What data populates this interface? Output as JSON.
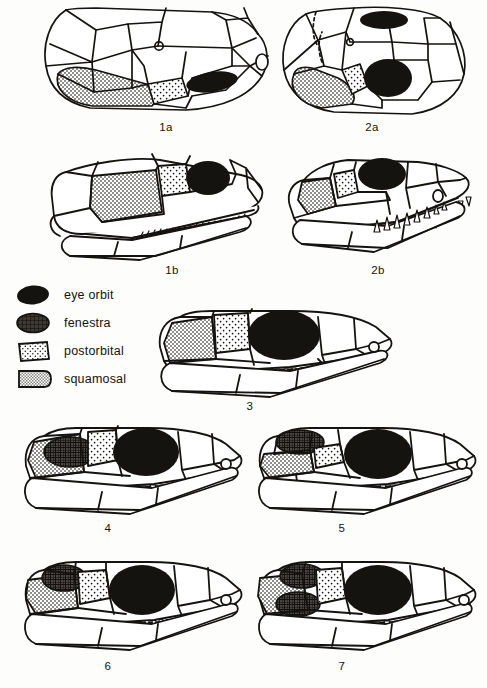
{
  "figure": {
    "type": "scientific-illustration",
    "background_color": "#fdfdfb",
    "ink_color": "#15130f"
  },
  "legend": {
    "items": [
      {
        "key": "eye-orbit",
        "label": "eye  orbit",
        "swatch": "solid-black-blob",
        "fill": "#15130f"
      },
      {
        "key": "fenestra",
        "label": "fenestra",
        "swatch": "crosshatched-blob",
        "fill": "#2b2723"
      },
      {
        "key": "postorbital",
        "label": "postorbital",
        "swatch": "dotted-parallelogram",
        "fill": "#ffffff"
      },
      {
        "key": "squamosal",
        "label": "squamosal",
        "swatch": "stippled-gray-shape",
        "fill": "#b9b9b5"
      }
    ]
  },
  "panels": [
    {
      "id": "1a",
      "caption": "1a",
      "view": "dorsal",
      "row": 1,
      "col": 1
    },
    {
      "id": "2a",
      "caption": "2a",
      "view": "dorsal",
      "row": 1,
      "col": 2
    },
    {
      "id": "1b",
      "caption": "1b",
      "view": "lateral",
      "row": 2,
      "col": 1
    },
    {
      "id": "2b",
      "caption": "2b",
      "view": "lateral",
      "row": 2,
      "col": 2
    },
    {
      "id": "3",
      "caption": "3",
      "view": "lateral",
      "row": 3,
      "col": 0
    },
    {
      "id": "4",
      "caption": "4",
      "view": "lateral",
      "row": 4,
      "col": 1
    },
    {
      "id": "5",
      "caption": "5",
      "view": "lateral",
      "row": 4,
      "col": 2
    },
    {
      "id": "6",
      "caption": "6",
      "view": "lateral",
      "row": 5,
      "col": 1
    },
    {
      "id": "7",
      "caption": "7",
      "view": "lateral",
      "row": 5,
      "col": 2
    }
  ]
}
